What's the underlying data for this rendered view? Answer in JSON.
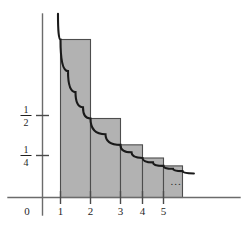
{
  "figure": {
    "caption": "",
    "background_color": "#ffffff",
    "bar_fill_color": "#b2b2b2",
    "bar_stroke_color": "#4d4d4d",
    "curve_color": "#1a1a1a",
    "axis_color": "#6b6b6b",
    "ellipsis_label": "..."
  },
  "chart_data": {
    "type": "bar",
    "title": "",
    "xlabel": "",
    "ylabel": "",
    "categories": [
      "1",
      "2",
      "3",
      "4",
      "5"
    ],
    "values": [
      1,
      0.5,
      0.3333,
      0.25,
      0.2
    ],
    "value_labels": [
      "1",
      "1/2",
      "1/3",
      "1/4",
      "1/5"
    ],
    "bar_intervals": [
      [
        1,
        2
      ],
      [
        2,
        3
      ],
      [
        3,
        4
      ],
      [
        4,
        5
      ],
      [
        5,
        6
      ]
    ],
    "xlim": [
      0,
      6.6
    ],
    "ylim": [
      0,
      1.18
    ],
    "grid": false,
    "legend": null,
    "x_ticks": [
      {
        "value": 0,
        "label": "0"
      },
      {
        "value": 1,
        "label": "1"
      },
      {
        "value": 2,
        "label": "2"
      },
      {
        "value": 3,
        "label": "3"
      },
      {
        "value": 4,
        "label": "4"
      },
      {
        "value": 5,
        "label": "5"
      }
    ],
    "y_ticks": [
      {
        "value": 0.5,
        "numerator": "1",
        "denominator": "2"
      },
      {
        "value": 0.25,
        "numerator": "1",
        "denominator": "4"
      }
    ],
    "series": [
      {
        "name": "y = 1/x",
        "type": "line",
        "function": "1/x",
        "x_start": 0.86,
        "x_end": 6.6,
        "points": [
          {
            "x": 0.86,
            "y": 1.163
          },
          {
            "x": 1.0,
            "y": 1.0
          },
          {
            "x": 1.25,
            "y": 0.8
          },
          {
            "x": 1.5,
            "y": 0.667
          },
          {
            "x": 1.75,
            "y": 0.571
          },
          {
            "x": 2.0,
            "y": 0.5
          },
          {
            "x": 2.5,
            "y": 0.4
          },
          {
            "x": 3.0,
            "y": 0.333
          },
          {
            "x": 3.5,
            "y": 0.286
          },
          {
            "x": 4.0,
            "y": 0.25
          },
          {
            "x": 4.5,
            "y": 0.222
          },
          {
            "x": 5.0,
            "y": 0.2
          },
          {
            "x": 5.5,
            "y": 0.182
          },
          {
            "x": 6.0,
            "y": 0.167
          },
          {
            "x": 6.6,
            "y": 0.152
          }
        ]
      }
    ],
    "annotations": [
      {
        "text": "...",
        "x": 5.45,
        "y": 0.13
      }
    ]
  }
}
